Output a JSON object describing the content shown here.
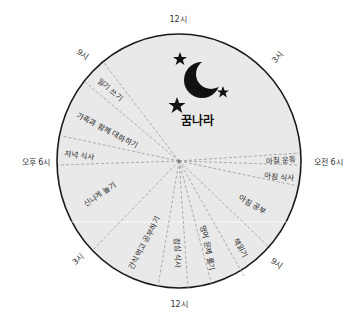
{
  "diagram": {
    "title": "꿈나라",
    "colors": {
      "background": "#ffffff",
      "circle_fill": "#e9e9e9",
      "circle_stroke": "#1a1a1a",
      "divider": "#9a9a9a",
      "icon": "#111111"
    },
    "clock_labels": {
      "top": "12시",
      "top_right": "3시",
      "right": "오전 6시",
      "bottom_right": "9시",
      "bottom": "12시",
      "bottom_left": "3시",
      "left": "오후 6시",
      "top_left": "9시"
    },
    "segments": [
      {
        "label": "꿈나라",
        "period": "9pm–6am"
      },
      {
        "label": "아침 운동"
      },
      {
        "label": "아침 식사"
      },
      {
        "label": "아침 공부"
      },
      {
        "label": "책읽기"
      },
      {
        "label": "영어 문제 풀기"
      },
      {
        "label": "점심 식사"
      },
      {
        "label": "간식먹고 공부하기"
      },
      {
        "label": "신나게 놀기"
      },
      {
        "label": "저녁 식사"
      },
      {
        "label": "가족과 함께 대화하기"
      },
      {
        "label": "일기 쓰기"
      }
    ],
    "icons": [
      "moon-icon",
      "star-icon",
      "star-icon",
      "star-icon"
    ]
  }
}
